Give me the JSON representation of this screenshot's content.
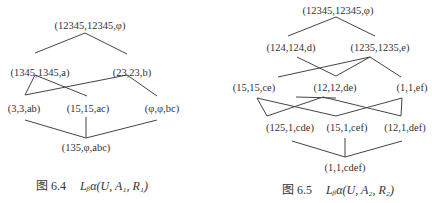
{
  "figures": [
    {
      "id": "fig-6-4",
      "caption": {
        "label": "图 6.4",
        "formula": "Lᵦα(U, A₁, R₁)"
      },
      "nodes": [
        {
          "id": "top",
          "label": "(12345,12345,φ)"
        },
        {
          "id": "n1345",
          "label": "(1345,1345,a)"
        },
        {
          "id": "n23",
          "label": "(23,23,b)"
        },
        {
          "id": "n3",
          "label": "(3,3,ab)"
        },
        {
          "id": "n15",
          "label": "(15,15,ac)"
        },
        {
          "id": "nphi",
          "label": "(φ,φ,bc)"
        },
        {
          "id": "bottom",
          "label": "(135,φ,abc)"
        }
      ],
      "edges": [
        [
          "top",
          "n1345"
        ],
        [
          "top",
          "n23"
        ],
        [
          "n1345",
          "n3"
        ],
        [
          "n1345",
          "n15"
        ],
        [
          "n23",
          "n3"
        ],
        [
          "n23",
          "nphi"
        ],
        [
          "n3",
          "bottom"
        ],
        [
          "n15",
          "bottom"
        ],
        [
          "nphi",
          "bottom"
        ]
      ]
    },
    {
      "id": "fig-6-5",
      "caption": {
        "label": "图 6.5",
        "formula": "Lᵦα(U, A₂, R₂)"
      },
      "nodes": [
        {
          "id": "top",
          "label": "(12345,12345,φ)"
        },
        {
          "id": "n124",
          "label": "(124,124,d)"
        },
        {
          "id": "n1235",
          "label": "(1235,1235,e)"
        },
        {
          "id": "n15ce",
          "label": "(15,15,ce)"
        },
        {
          "id": "n12de",
          "label": "(12,12,de)"
        },
        {
          "id": "n1ef",
          "label": "(1,1,ef)"
        },
        {
          "id": "n125",
          "label": "(125,1,cde)"
        },
        {
          "id": "n15cef",
          "label": "(15,1,cef)"
        },
        {
          "id": "n12def",
          "label": "(12,1,def)"
        },
        {
          "id": "bottom",
          "label": "(1,1,cdef)"
        }
      ],
      "edges": [
        [
          "top",
          "n124"
        ],
        [
          "top",
          "n1235"
        ],
        [
          "n124",
          "n12de"
        ],
        [
          "n1235",
          "n15ce"
        ],
        [
          "n1235",
          "n12de"
        ],
        [
          "n1235",
          "n1ef"
        ],
        [
          "n15ce",
          "n125"
        ],
        [
          "n15ce",
          "n15cef"
        ],
        [
          "n12de",
          "n125"
        ],
        [
          "n12de",
          "n12def"
        ],
        [
          "n1ef",
          "n15cef"
        ],
        [
          "n1ef",
          "n12def"
        ],
        [
          "n125",
          "bottom"
        ],
        [
          "n15cef",
          "bottom"
        ],
        [
          "n12def",
          "bottom"
        ]
      ]
    }
  ]
}
